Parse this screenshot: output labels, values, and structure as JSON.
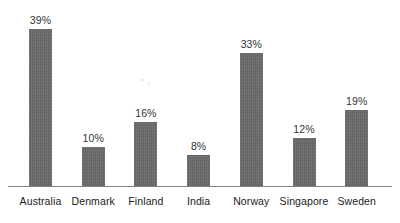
{
  "chart_data": {
    "type": "bar",
    "title": "",
    "subtitle": "",
    "xlabel": "",
    "ylabel": "",
    "categories": [
      "Australia",
      "Denmark",
      "Finland",
      "India",
      "Norway",
      "Singapore",
      "Sweden"
    ],
    "values": [
      39,
      10,
      16,
      8,
      33,
      12,
      19
    ],
    "value_labels": [
      "39%",
      "10%",
      "16%",
      "8%",
      "33%",
      "12%",
      "19%"
    ],
    "value_suffix": "%",
    "ylim": [
      0,
      39
    ],
    "grid": false,
    "legend": false,
    "legend_position": "none",
    "y_axis_visible": false,
    "x_axis_visible": true,
    "data_labels_shown": true,
    "orientation": "vertical",
    "bar_color": "#6b6b6b",
    "axis_color": "#828282",
    "label_color": "#1a1a1a",
    "value_label_color": "#333333",
    "background_color": "#ffffff"
  }
}
